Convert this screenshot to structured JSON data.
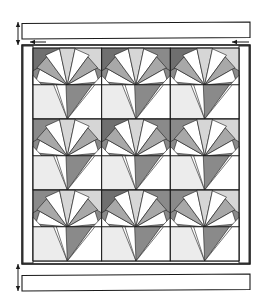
{
  "figure": {
    "type": "quilt-pattern-diagram",
    "title": "",
    "canvas": {
      "width": 278,
      "height": 301
    }
  },
  "colors": {
    "outline": "#1a1a1a",
    "white": "#ffffff",
    "very_light_gray": "#ececec",
    "light_gray": "#d6d6d6",
    "medium_gray": "#a8a8a8",
    "dark_gray": "#8a8a8a",
    "darker_gray": "#6f6f6f",
    "sashing": "#f2f2f2"
  },
  "layout": {
    "quilt_body": {
      "x": 22,
      "y": 45,
      "width": 228,
      "height": 219
    },
    "inner_field": {
      "x": 33,
      "y": 48,
      "width": 206,
      "height": 213
    },
    "grid": {
      "rows": 3,
      "cols": 3,
      "cell_width": 68.7,
      "cell_height": 71.0
    },
    "left_border_strip": {
      "x": 23,
      "y": 46,
      "width": 10,
      "height": 217
    },
    "right_border_strip": {
      "x": 239,
      "y": 46,
      "width": 10,
      "height": 217
    }
  },
  "border_strips": [
    {
      "name": "top-border-strip",
      "x": 22,
      "y": 22,
      "width": 228,
      "height": 17
    },
    {
      "name": "bottom-border-strip",
      "x": 22,
      "y": 274,
      "width": 228,
      "height": 17
    }
  ],
  "dimension_markers": [
    {
      "name": "left-vertical-dimension-top",
      "x": 18,
      "y1": 22,
      "y2": 45,
      "orientation": "vertical"
    },
    {
      "name": "left-vertical-dimension-bottom",
      "x": 18,
      "y1": 264,
      "y2": 291,
      "orientation": "vertical"
    },
    {
      "name": "top-left-horizontal-arrow",
      "x1": 30,
      "x2": 46,
      "y": 42,
      "orientation": "horizontal"
    },
    {
      "name": "top-right-horizontal-arrow",
      "x1": 232,
      "x2": 249,
      "y": 42,
      "orientation": "horizontal"
    }
  ],
  "block": {
    "name": "fan-block",
    "description": "Square pieced block: sunburst fan in upper-left half, large triangular fan fill in lower half",
    "fan_blades": 7,
    "repeat_count": 9
  },
  "chart_data": {
    "type": "table",
    "categories": [
      "row 1",
      "row 2",
      "row 3"
    ],
    "values": [
      3,
      3,
      3
    ]
  }
}
